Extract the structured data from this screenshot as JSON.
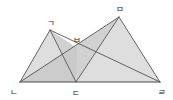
{
  "figure": {
    "canvas": {
      "width": 173,
      "height": 100
    },
    "background_color": "#ffffff",
    "line_color": "#555555",
    "shade_color": "#c9c9c9",
    "label_color": "#2b2b2b",
    "points": [
      {
        "id": "n",
        "label": "ㅌ",
        "x": 20,
        "y": 82,
        "label_x": 14,
        "label_y": 92
      },
      {
        "id": "d",
        "label": "ㄷ",
        "x": 76,
        "y": 82,
        "label_x": 76,
        "label_y": 93
      },
      {
        "id": "r",
        "label": "ㄹ",
        "x": 160,
        "y": 82,
        "label_x": 162,
        "label_y": 92
      },
      {
        "id": "g",
        "label": "ㄱ",
        "x": 50,
        "y": 30,
        "label_x": 51,
        "label_y": 23
      },
      {
        "id": "m",
        "label": "ㅁ",
        "x": 119,
        "y": 17,
        "label_x": 120,
        "label_y": 9
      },
      {
        "id": "b",
        "label": "ㅂ",
        "x": 77,
        "y": 48,
        "label_x": 77,
        "label_y": 40
      }
    ],
    "point_labels": {
      "n": "ㄴ",
      "d": "ㄷ",
      "r": "ㄹ",
      "g": "ㄱ",
      "m": "ㅁ",
      "b": "ㅂ"
    },
    "segments": [
      {
        "name": "base-n-r",
        "from": "n",
        "to": "r",
        "style": "base"
      },
      {
        "name": "side-n-g",
        "from": "n",
        "to": "g",
        "style": "normal"
      },
      {
        "name": "side-g-d",
        "from": "g",
        "to": "d",
        "style": "normal"
      },
      {
        "name": "side-d-m",
        "from": "d",
        "to": "m",
        "style": "normal"
      },
      {
        "name": "side-m-r",
        "from": "m",
        "to": "r",
        "style": "normal"
      },
      {
        "name": "diag-n-m",
        "from": "n",
        "to": "m",
        "style": "normal"
      },
      {
        "name": "diag-g-r",
        "from": "g",
        "to": "r",
        "style": "normal"
      }
    ],
    "shaded_regions": [
      {
        "name": "shade-g-d-n-area",
        "points": [
          "g",
          "d",
          "n"
        ],
        "tone": "light"
      },
      {
        "name": "shade-n-d-m",
        "points": [
          "n",
          "d",
          "m"
        ],
        "tone": "dark"
      },
      {
        "name": "shade-d-m-r",
        "points": [
          "d",
          "m",
          "r"
        ],
        "tone": "light"
      },
      {
        "name": "shade-g-b-d",
        "points": [
          "g",
          "b",
          "d"
        ],
        "tone": "dark"
      }
    ]
  }
}
